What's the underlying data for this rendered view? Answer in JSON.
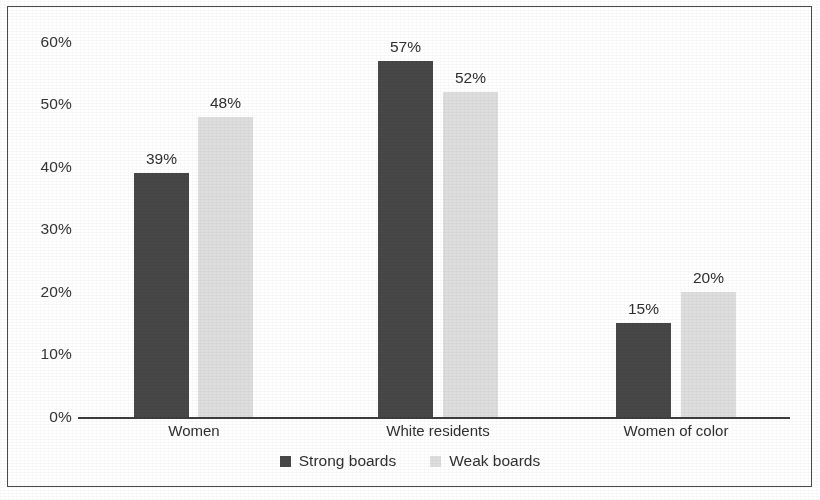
{
  "chart_data": {
    "type": "bar",
    "title": "",
    "subtitle": "",
    "xlabel": "",
    "ylabel": "",
    "categories": [
      "Women",
      "White residents",
      "Women of color"
    ],
    "series": [
      {
        "name": "Strong boards",
        "color": "#474747",
        "values": [
          39,
          48,
          15
        ]
      },
      {
        "name": "Weak boards",
        "color": "#dedede",
        "values": [
          48,
          52,
          20
        ]
      }
    ],
    "series_correction_note": "",
    "ylim": [
      0,
      60
    ],
    "yticks": [
      0,
      10,
      20,
      30,
      40,
      50,
      60
    ],
    "ytick_labels": [
      "0%",
      "10%",
      "20%",
      "30%",
      "40%",
      "50%",
      "60%"
    ],
    "grid": false,
    "legend_position": "bottom",
    "data_labels": [
      [
        "39%",
        "48%"
      ],
      [
        "57%",
        "52%"
      ],
      [
        "15%",
        "20%"
      ]
    ],
    "value_matrix": [
      {
        "category": "Women",
        "strong_boards": 39,
        "weak_boards": 48
      },
      {
        "category": "White residents",
        "strong_boards": 57,
        "weak_boards": 52
      },
      {
        "category": "Women of color",
        "strong_boards": 15,
        "weak_boards": 20
      }
    ]
  },
  "axis": {
    "ytick_labels": [
      "60%",
      "50%",
      "40%",
      "30%",
      "20%",
      "10%",
      "0%"
    ]
  },
  "legend": {
    "items": [
      {
        "label": "Strong boards",
        "color": "#474747"
      },
      {
        "label": "Weak boards",
        "color": "#dedede"
      }
    ]
  }
}
